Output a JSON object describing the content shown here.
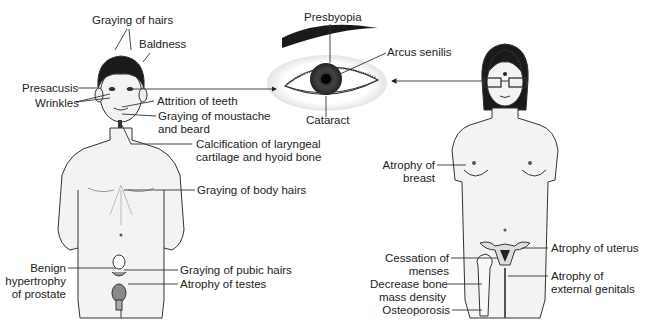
{
  "figure": {
    "type": "medical illustration",
    "colors": {
      "line": "#333333",
      "skin": "#f2f2f2",
      "hair": "#1a1a1a",
      "background": "#ffffff"
    }
  },
  "eye": {
    "labels": {
      "presbyopia": "Presbyopia",
      "arcus_senilis": "Arcus senilis",
      "cataract": "Cataract"
    }
  },
  "male": {
    "labels": {
      "graying_hairs": "Graying of hairs",
      "baldness": "Baldness",
      "presacusis": "Presacusis",
      "wrinkles": "Wrinkles",
      "attrition_teeth": "Attrition of teeth",
      "moustache_1": "Graying of moustache",
      "moustache_2": "and beard",
      "calcification_1": "Calcification of laryngeal",
      "calcification_2": "cartilage and hyoid bone",
      "body_hairs": "Graying of body hairs",
      "prostate_1": "Benign",
      "prostate_2": "hypertrophy",
      "prostate_3": "of prostate",
      "pubic_hairs": "Graying of pubic hairs",
      "testes": "Atrophy of testes"
    }
  },
  "female": {
    "labels": {
      "breast_1": "Atrophy of",
      "breast_2": "breast",
      "menses_1": "Cessation of",
      "menses_2": "menses",
      "bone_1": "Decrease bone",
      "bone_2": "mass density",
      "osteoporosis": "Osteoporosis",
      "uterus": "Atrophy of uterus",
      "genitals_1": "Atrophy of",
      "genitals_2": "external genitals"
    }
  }
}
